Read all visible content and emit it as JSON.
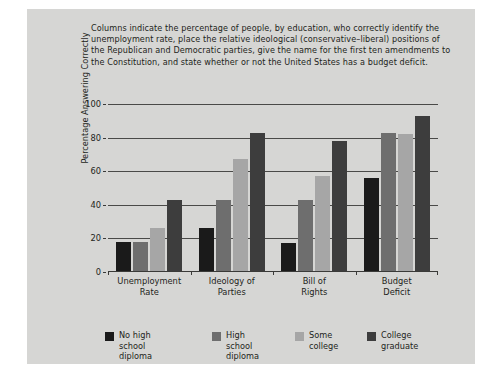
{
  "figure": {
    "caption": "Columns indicate the percentage of people, by education, who correctly identify the unemployment rate, place the relative ideological (conservative–liberal) positions of the Republican and Democratic parties, give the name for the first ten amendments to the Constitution, and state whether or not the United States has a budget deficit.",
    "panel_color": "#d6d6d4",
    "background_color": "#ffffff"
  },
  "chart_data": {
    "type": "bar",
    "title": "",
    "xlabel": "",
    "ylabel": "Percentage Answering Correctly",
    "ylim": [
      0,
      100
    ],
    "yticks": [
      0,
      20,
      40,
      60,
      80,
      100
    ],
    "ytick_labels": [
      "0",
      "20",
      "40",
      "60",
      "80",
      "100"
    ],
    "grid": true,
    "legend_position": "bottom",
    "categories": [
      "Unemployment Rate",
      "Ideology of Parties",
      "Bill of Rights",
      "Budget Deficit"
    ],
    "category_lines": [
      [
        "Unemployment",
        "Rate"
      ],
      [
        "Ideology of",
        "Parties"
      ],
      [
        "Bill of",
        "Rights"
      ],
      [
        "Budget",
        "Deficit"
      ]
    ],
    "series": [
      {
        "name": "No high school diploma",
        "name_lines": [
          "No high",
          "school diploma"
        ],
        "color": "#1a1a1a",
        "values": [
          18,
          26,
          17,
          56
        ]
      },
      {
        "name": "High school diploma",
        "name_lines": [
          "High school",
          "diploma"
        ],
        "color": "#6e6e6e",
        "values": [
          18,
          43,
          43,
          83
        ]
      },
      {
        "name": "Some college",
        "name_lines": [
          "Some",
          "college"
        ],
        "color": "#a6a6a6",
        "values": [
          26,
          67,
          57,
          82
        ]
      },
      {
        "name": "College graduate",
        "name_lines": [
          "College",
          "graduate"
        ],
        "color": "#3d3d3d",
        "values": [
          43,
          83,
          78,
          93
        ]
      }
    ]
  }
}
